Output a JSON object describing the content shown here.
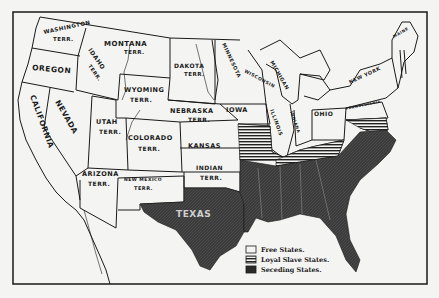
{
  "map": {
    "title": "United States 1861",
    "colors": {
      "background": "#f4f4f2",
      "ink": "#1a1a1a",
      "free": "#f4f4f2",
      "seceding": "#3a3a3a"
    },
    "labels": {
      "washington": "WASHINGTON",
      "washington_terr": "TERR.",
      "montana": "MONTANA",
      "montana_terr": "TERR.",
      "oregon": "OREGON",
      "idaho": "IDAHO",
      "idaho_terr": "TERR.",
      "dakota": "DAKOTA",
      "dakota_terr": "TERR.",
      "minnesota": "MINNESOTA",
      "wisconsin": "WISCONSIN",
      "michigan": "MICHIGAN",
      "new_york": "NEW YORK",
      "maine": "MAINE",
      "pennsylvania": "PENNSYLVANIA",
      "wyoming": "WYOMING",
      "wyoming_terr": "TERR.",
      "nebraska": "NEBRASKA",
      "nebraska_terr": "TERR.",
      "iowa": "IOWA",
      "illinois": "ILLINOIS",
      "indiana": "INDIANA",
      "ohio": "OHIO",
      "california": "CALIFORNIA",
      "nevada": "NEVADA",
      "utah": "UTAH",
      "utah_terr": "TERR.",
      "colorado": "COLORADO",
      "colorado_terr": "TERR.",
      "kansas": "KANSAS",
      "indian": "INDIAN",
      "indian_terr": "TERR.",
      "arizona": "ARIZONA",
      "arizona_terr": "TERR.",
      "new_mexico": "NEW MEXICO",
      "new_mexico_terr": "TERR.",
      "texas": "TEXAS"
    },
    "legend": {
      "items": [
        {
          "label": "Free States.",
          "pattern": "free"
        },
        {
          "label": "Loyal Slave States.",
          "pattern": "loyal"
        },
        {
          "label": "Seceding States.",
          "pattern": "seceding"
        }
      ]
    }
  }
}
